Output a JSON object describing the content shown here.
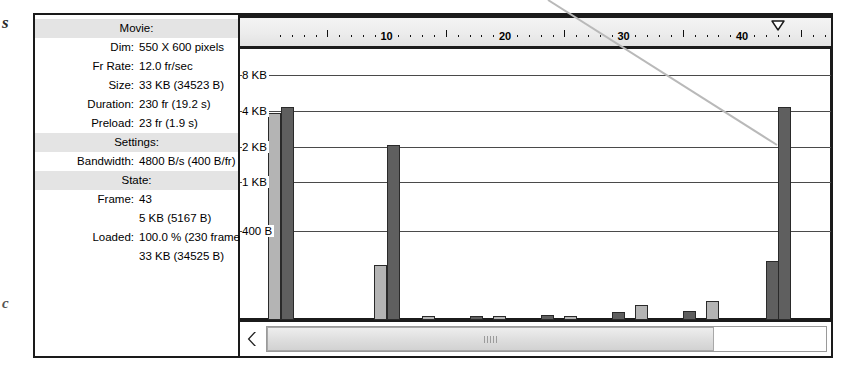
{
  "margin_text": {
    "left_top": "s",
    "left_bottom": "c"
  },
  "info_panel": {
    "sections": [
      {
        "type": "header",
        "label": "Movie:"
      },
      {
        "type": "row",
        "label": "Dim:",
        "value": "550 X 600 pixels"
      },
      {
        "type": "row",
        "label": "Fr Rate:",
        "value": "12.0 fr/sec"
      },
      {
        "type": "row",
        "label": "Size:",
        "value": "33 KB (34523 B)"
      },
      {
        "type": "row",
        "label": "Duration:",
        "value": "230 fr (19.2 s)"
      },
      {
        "type": "row",
        "label": "Preload:",
        "value": "23 fr (1.9 s)"
      },
      {
        "type": "header",
        "label": "Settings:"
      },
      {
        "type": "row",
        "label": "Bandwidth:",
        "value": "4800 B/s (400 B/fr)"
      },
      {
        "type": "header",
        "label": "State:"
      },
      {
        "type": "row",
        "label": "Frame:",
        "value": "43"
      },
      {
        "type": "row",
        "label": "",
        "value": "5 KB (5167 B)"
      },
      {
        "type": "row",
        "label": "Loaded:",
        "value": "100.0 % (230 frames)"
      },
      {
        "type": "row",
        "label": "",
        "value": "33 KB (34525 B)"
      }
    ]
  },
  "ruler": {
    "labels": [
      "10",
      "20",
      "30",
      "40"
    ],
    "playhead_frame": "43"
  },
  "scrollbar": {
    "left_arrow": "scroll-left-arrow",
    "thumb_grip": "grip-dots"
  },
  "colors": {
    "bar_light": "#b4b4b4",
    "bar_dark": "#5f5f5f",
    "section_band": "#e4e4e4",
    "border": "#1a1a1a"
  },
  "chart_data": {
    "type": "bar",
    "title": "",
    "xlabel": "",
    "ylabel": "",
    "grid": true,
    "legend": "none",
    "ytick_labels": [
      "8 KB",
      "4 KB",
      "2 KB",
      "1 KB",
      "400 B"
    ],
    "ytick_values": [
      8192,
      4096,
      2048,
      1024,
      400
    ],
    "ylim": [
      0,
      9500
    ],
    "yscale": "log",
    "xlim": [
      1,
      47
    ],
    "categories": [
      1,
      1,
      2,
      10,
      10,
      14,
      17,
      20,
      23,
      26,
      29,
      32,
      35,
      38,
      42,
      43
    ],
    "series": [
      {
        "name": "frame-bytes",
        "bars": [
          {
            "frame": 1,
            "value": 8192,
            "shade": "light"
          },
          {
            "frame": 1,
            "value": 9200,
            "shade": "dark"
          },
          {
            "frame": 10,
            "value": 430,
            "shade": "light"
          },
          {
            "frame": 10,
            "value": 4400,
            "shade": "dark"
          },
          {
            "frame": 14,
            "value": 130,
            "shade": "light"
          },
          {
            "frame": 17,
            "value": 140,
            "shade": "dark"
          },
          {
            "frame": 20,
            "value": 140,
            "shade": "light"
          },
          {
            "frame": 23,
            "value": 165,
            "shade": "dark"
          },
          {
            "frame": 26,
            "value": 160,
            "shade": "light"
          },
          {
            "frame": 29,
            "value": 175,
            "shade": "dark"
          },
          {
            "frame": 32,
            "value": 200,
            "shade": "light"
          },
          {
            "frame": 35,
            "value": 180,
            "shade": "dark"
          },
          {
            "frame": 38,
            "value": 215,
            "shade": "light"
          },
          {
            "frame": 42,
            "value": 470,
            "shade": "dark"
          },
          {
            "frame": 43,
            "value": 9200,
            "shade": "dark"
          }
        ]
      }
    ]
  }
}
